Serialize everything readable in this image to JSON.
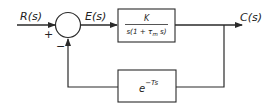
{
  "diagram": {
    "type": "feedback-control-block-diagram",
    "signals": {
      "input": "R(s)",
      "error": "E(s)",
      "output": "C(s)"
    },
    "summing_junction": {
      "plus_sign": "+",
      "minus_sign": "−"
    },
    "forward_block": {
      "numerator": "K",
      "denominator_prefix": "s(1 + τ",
      "denominator_sub": "m",
      "denominator_suffix": " s)"
    },
    "feedback_block": {
      "base": "e",
      "exponent": "−Ts"
    },
    "colors": {
      "line": "#2a2a2a",
      "background": "#ffffff"
    }
  }
}
